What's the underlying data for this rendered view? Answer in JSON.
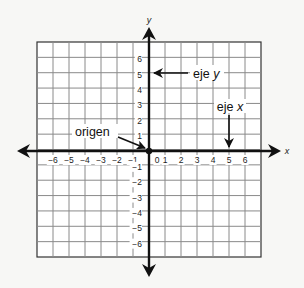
{
  "diagram": {
    "type": "coordinate-plane",
    "x_axis": {
      "name": "x",
      "min": -6,
      "max": 6,
      "ticks": [
        -6,
        -5,
        -4,
        -3,
        -2,
        -1,
        0,
        1,
        2,
        3,
        4,
        5,
        6
      ]
    },
    "y_axis": {
      "name": "y",
      "min": -6,
      "max": 6,
      "ticks": [
        6,
        5,
        4,
        3,
        2,
        1,
        -1,
        -2,
        -3,
        -4,
        -5,
        -6
      ]
    },
    "grid": {
      "columns": 14,
      "rows": 14
    },
    "labels": {
      "origin": "origen",
      "y_axis_prefix": "eje ",
      "y_axis_var": "y",
      "x_axis_prefix": "eje ",
      "x_axis_var": "x"
    },
    "colors": {
      "axis": "#111111",
      "grid": "#8a8a8a",
      "background": "#f7f7f5"
    }
  }
}
